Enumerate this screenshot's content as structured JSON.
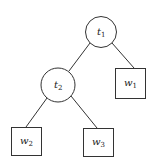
{
  "diagram": {
    "type": "tree",
    "nodes": [
      {
        "id": "t1",
        "label": "t",
        "sub": "1",
        "shape": "circle"
      },
      {
        "id": "t2",
        "label": "t",
        "sub": "2",
        "shape": "circle"
      },
      {
        "id": "w1",
        "label": "w",
        "sub": "1",
        "shape": "square"
      },
      {
        "id": "w2",
        "label": "w",
        "sub": "2",
        "shape": "square"
      },
      {
        "id": "w3",
        "label": "w",
        "sub": "3",
        "shape": "square"
      }
    ],
    "edges": [
      {
        "from": "t1",
        "to": "t2"
      },
      {
        "from": "t1",
        "to": "w1"
      },
      {
        "from": "t2",
        "to": "w2"
      },
      {
        "from": "t2",
        "to": "w3"
      }
    ],
    "colors": {
      "stroke": "#333333",
      "background": "#ffffff"
    }
  }
}
